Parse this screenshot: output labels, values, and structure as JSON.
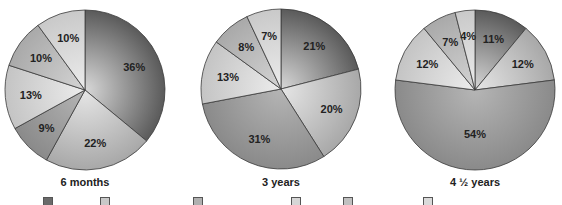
{
  "chart_data": [
    {
      "type": "pie",
      "title": "6 months",
      "slices_clockwise_from_top": [
        36,
        22,
        9,
        13,
        10,
        10
      ],
      "labels": [
        "36%",
        "22%",
        "9%",
        "13%",
        "10%",
        "10%"
      ]
    },
    {
      "type": "pie",
      "title": "3 years",
      "slices_clockwise_from_top": [
        21,
        20,
        31,
        13,
        8,
        7
      ],
      "labels": [
        "21%",
        "20%",
        "31%",
        "13%",
        "8%",
        "7%"
      ]
    },
    {
      "type": "pie",
      "title": "4 ½ years",
      "slices_clockwise_from_top": [
        11,
        12,
        54,
        12,
        7,
        4
      ],
      "labels": [
        "11%",
        "12%",
        "54%",
        "12%",
        "7%",
        "4%"
      ]
    }
  ],
  "pies": [
    {
      "title": "6 months",
      "cx": 85,
      "cy": 90,
      "r": 80,
      "values": [
        36,
        22,
        9,
        13,
        10,
        10
      ]
    },
    {
      "title": "3 years",
      "cx": 281,
      "cy": 89,
      "r": 80,
      "values": [
        21,
        20,
        31,
        13,
        8,
        7
      ]
    },
    {
      "title": "4 ½ years",
      "cx": 475,
      "cy": 90,
      "r": 80,
      "values": [
        11,
        12,
        54,
        12,
        7,
        4
      ]
    }
  ],
  "slice_colors": [
    {
      "inner": "#d8d8d8",
      "outer": "#5a5a5a"
    },
    {
      "inner": "#e6e6e6",
      "outer": "#a8a8a8"
    },
    {
      "inner": "#b5b5b5",
      "outer": "#8a8a8a"
    },
    {
      "inner": "#ececec",
      "outer": "#c4c4c4"
    },
    {
      "inner": "#d4d4d4",
      "outer": "#a9a9a9"
    },
    {
      "inner": "#ececec",
      "outer": "#c9c9c9"
    }
  ],
  "legend": {
    "swatches": [
      {
        "x": 43,
        "color": "#6a6a6a"
      },
      {
        "x": 100,
        "color": "#c8c8c8"
      },
      {
        "x": 193,
        "color": "#b0b0b0"
      },
      {
        "x": 291,
        "color": "#d6d6d6"
      },
      {
        "x": 343,
        "color": "#c0c0c0"
      },
      {
        "x": 423,
        "color": "#dadada"
      }
    ]
  }
}
